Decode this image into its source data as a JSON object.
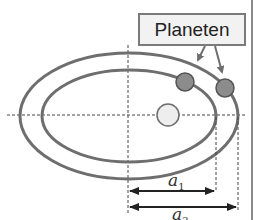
{
  "diagram": {
    "callout_label": "Planeten",
    "labels": {
      "a1": {
        "base": "a",
        "sub": "1"
      },
      "a2": {
        "base": "a",
        "sub": "2"
      }
    },
    "elements": {
      "inner_orbit": "ellipse",
      "outer_orbit": "ellipse",
      "sun": "circle",
      "planets": [
        "planet-inner-orbit",
        "planet-outer-orbit"
      ]
    },
    "colors": {
      "orbit": "#6e6e6e",
      "planet": "#8c8c8c",
      "sun": "#eeeeee",
      "label_bg": "#f2f2f2",
      "border": "#7a7a7a"
    }
  }
}
